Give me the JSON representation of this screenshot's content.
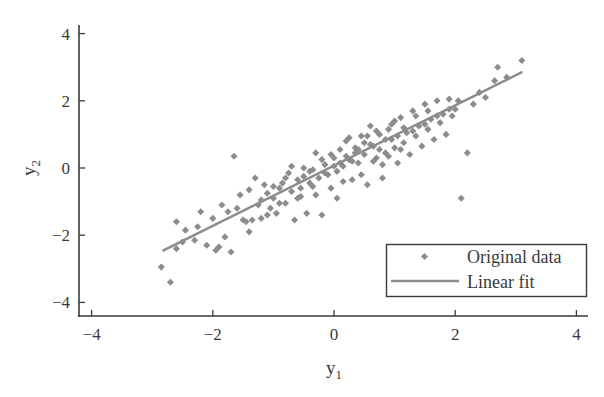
{
  "chart_data": {
    "type": "scatter",
    "title": "",
    "xlabel": "y",
    "xlabel_sub": "1",
    "ylabel": "y",
    "ylabel_sub": "2",
    "xlim": [
      -4.2,
      4.2
    ],
    "ylim": [
      -4.3,
      4.3
    ],
    "xticks": [
      -4,
      -2,
      0,
      2,
      4
    ],
    "yticks": [
      -4,
      -2,
      0,
      2,
      4
    ],
    "xtick_labels": [
      "−4",
      "−2",
      "0",
      "2",
      "4"
    ],
    "ytick_labels": [
      "−4",
      "−2",
      "0",
      "2",
      "4"
    ],
    "grid": false,
    "legend_position": "lower right",
    "colors": {
      "points": "#8c8c8c",
      "line": "#8c8c8c",
      "axis": "#3a3a3a"
    },
    "series": [
      {
        "name": "Original data",
        "kind": "scatter",
        "marker": "diamond",
        "points": [
          [
            -2.85,
            -2.95
          ],
          [
            -2.7,
            -3.4
          ],
          [
            -2.6,
            -1.6
          ],
          [
            -2.5,
            -2.2
          ],
          [
            -2.45,
            -1.85
          ],
          [
            -2.3,
            -2.15
          ],
          [
            -2.25,
            -1.75
          ],
          [
            -2.1,
            -2.3
          ],
          [
            -2.0,
            -1.5
          ],
          [
            -1.95,
            -2.45
          ],
          [
            -1.9,
            -2.35
          ],
          [
            -1.85,
            -1.1
          ],
          [
            -1.8,
            -2.05
          ],
          [
            -1.75,
            -1.3
          ],
          [
            -1.7,
            -2.5
          ],
          [
            -1.65,
            0.35
          ],
          [
            -1.55,
            -0.8
          ],
          [
            -1.5,
            -1.55
          ],
          [
            -1.45,
            -1.6
          ],
          [
            -1.4,
            -1.9
          ],
          [
            -1.35,
            -1.55
          ],
          [
            -1.3,
            -0.3
          ],
          [
            -1.25,
            -1.1
          ],
          [
            -1.2,
            -0.95
          ],
          [
            -1.15,
            -0.5
          ],
          [
            -1.1,
            -0.75
          ],
          [
            -1.05,
            -1.2
          ],
          [
            -1.0,
            -0.9
          ],
          [
            -0.95,
            -1.35
          ],
          [
            -0.9,
            -0.6
          ],
          [
            -0.85,
            -0.45
          ],
          [
            -0.8,
            -1.05
          ],
          [
            -0.75,
            -0.15
          ],
          [
            -0.7,
            -0.7
          ],
          [
            -0.65,
            -1.55
          ],
          [
            -0.6,
            -0.35
          ],
          [
            -0.55,
            -0.85
          ],
          [
            -0.5,
            -0.25
          ],
          [
            -0.45,
            -1.35
          ],
          [
            -0.4,
            -0.1
          ],
          [
            -0.35,
            -0.55
          ],
          [
            -0.3,
            0.45
          ],
          [
            -0.25,
            -0.3
          ],
          [
            -0.2,
            -1.4
          ],
          [
            -0.15,
            0.1
          ],
          [
            -0.1,
            -0.2
          ],
          [
            -0.05,
            -0.6
          ],
          [
            0.0,
            0.3
          ],
          [
            0.05,
            -0.1
          ],
          [
            0.1,
            0.55
          ],
          [
            0.15,
            0.05
          ],
          [
            0.2,
            0.8
          ],
          [
            0.25,
            0.25
          ],
          [
            0.3,
            -0.35
          ],
          [
            0.35,
            0.6
          ],
          [
            0.4,
            0.15
          ],
          [
            0.45,
            0.95
          ],
          [
            0.5,
            0.4
          ],
          [
            0.55,
            -0.5
          ],
          [
            0.6,
            0.7
          ],
          [
            0.65,
            0.2
          ],
          [
            0.7,
            1.1
          ],
          [
            0.75,
            0.55
          ],
          [
            0.8,
            -0.3
          ],
          [
            0.85,
            0.85
          ],
          [
            0.9,
            0.35
          ],
          [
            0.95,
            1.3
          ],
          [
            1.0,
            0.6
          ],
          [
            1.05,
            0.15
          ],
          [
            1.1,
            1.5
          ],
          [
            1.15,
            0.75
          ],
          [
            1.2,
            1.05
          ],
          [
            1.25,
            0.4
          ],
          [
            1.3,
            1.7
          ],
          [
            1.35,
            0.95
          ],
          [
            1.4,
            1.25
          ],
          [
            1.45,
            0.65
          ],
          [
            1.5,
            1.9
          ],
          [
            1.55,
            1.15
          ],
          [
            1.6,
            1.45
          ],
          [
            1.65,
            0.85
          ],
          [
            1.7,
            2.0
          ],
          [
            1.75,
            1.35
          ],
          [
            1.8,
            1.6
          ],
          [
            1.85,
            1.0
          ],
          [
            1.9,
            2.05
          ],
          [
            1.95,
            1.55
          ],
          [
            2.0,
            1.75
          ],
          [
            2.1,
            -0.9
          ],
          [
            2.2,
            0.45
          ],
          [
            2.3,
            1.9
          ],
          [
            2.4,
            2.25
          ],
          [
            2.5,
            2.1
          ],
          [
            2.65,
            2.6
          ],
          [
            2.7,
            3.0
          ],
          [
            2.85,
            2.7
          ],
          [
            3.1,
            3.2
          ],
          [
            -0.5,
            0.0
          ],
          [
            -0.3,
            -0.8
          ],
          [
            0.05,
            -0.9
          ],
          [
            0.25,
            0.9
          ],
          [
            0.45,
            -0.2
          ],
          [
            0.6,
            1.25
          ],
          [
            0.8,
            0.1
          ],
          [
            1.0,
            1.4
          ],
          [
            -0.9,
            -1.05
          ],
          [
            -1.1,
            -1.4
          ],
          [
            -0.7,
            0.05
          ],
          [
            -0.2,
            0.25
          ],
          [
            0.15,
            -0.4
          ],
          [
            0.35,
            0.45
          ],
          [
            0.55,
            0.95
          ],
          [
            0.75,
            1.0
          ],
          [
            0.95,
            0.85
          ],
          [
            1.15,
            1.2
          ],
          [
            1.35,
            1.55
          ],
          [
            1.55,
            1.7
          ],
          [
            -1.0,
            -0.55
          ],
          [
            -0.6,
            -0.9
          ],
          [
            -0.4,
            -0.45
          ],
          [
            -0.15,
            -0.15
          ],
          [
            0.0,
            0.05
          ],
          [
            0.2,
            0.35
          ],
          [
            0.4,
            0.55
          ],
          [
            0.65,
            0.65
          ],
          [
            0.85,
            0.45
          ],
          [
            1.05,
            0.95
          ],
          [
            -1.2,
            -1.5
          ],
          [
            -0.8,
            -0.3
          ],
          [
            -0.55,
            -0.6
          ],
          [
            -0.35,
            -0.05
          ],
          [
            -0.05,
            0.4
          ],
          [
            0.1,
            0.15
          ],
          [
            0.3,
            0.2
          ],
          [
            0.5,
            0.75
          ],
          [
            0.7,
            0.3
          ],
          [
            0.9,
            1.15
          ],
          [
            1.1,
            0.55
          ],
          [
            1.3,
            1.1
          ],
          [
            1.5,
            1.3
          ],
          [
            1.7,
            1.55
          ],
          [
            1.9,
            1.75
          ],
          [
            2.05,
            2.0
          ],
          [
            -1.6,
            -1.2
          ],
          [
            -1.4,
            -0.65
          ],
          [
            -2.2,
            -1.3
          ],
          [
            -2.6,
            -2.4
          ]
        ]
      },
      {
        "name": "Linear fit",
        "kind": "line",
        "x": [
          -2.83,
          3.11
        ],
        "y": [
          -2.47,
          2.86
        ]
      }
    ]
  },
  "legend": {
    "items": [
      {
        "label": "Original data"
      },
      {
        "label": "Linear fit"
      }
    ]
  }
}
